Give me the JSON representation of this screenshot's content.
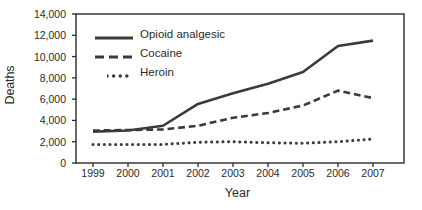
{
  "chart_data": {
    "type": "line",
    "title": "",
    "xlabel": "Year",
    "ylabel": "Deaths",
    "x": [
      1999,
      2000,
      2001,
      2002,
      2003,
      2004,
      2005,
      2006,
      2007
    ],
    "xtick_labels": [
      "1999",
      "2000",
      "2001",
      "2002",
      "2003",
      "2004",
      "2005",
      "2006",
      "2007"
    ],
    "ytick_labels": [
      "0",
      "2,000",
      "4,000",
      "6,000",
      "8,000",
      "10,000",
      "12,000",
      "14,000"
    ],
    "ytick_values": [
      0,
      2000,
      4000,
      6000,
      8000,
      10000,
      12000,
      14000
    ],
    "ylim": [
      0,
      14000
    ],
    "xlim": [
      1999,
      2007
    ],
    "grid": false,
    "legend_position": "upper-left-inside",
    "series": [
      {
        "name": "Opioid analgesic",
        "style": "solid",
        "color": "#3a3a3a",
        "values": [
          2950,
          3050,
          3500,
          5550,
          6550,
          7450,
          8550,
          11000,
          11500
        ]
      },
      {
        "name": "Cocaine",
        "style": "dashed",
        "color": "#3a3a3a",
        "values": [
          3050,
          3100,
          3150,
          3500,
          4250,
          4700,
          5400,
          6800,
          6100
        ]
      },
      {
        "name": "Heroin",
        "style": "dotted",
        "color": "#3a3a3a",
        "values": [
          1750,
          1750,
          1750,
          1950,
          2000,
          1900,
          1850,
          2000,
          2250
        ]
      }
    ]
  },
  "axis": {
    "y_title": "Deaths",
    "x_title": "Year"
  },
  "legend": {
    "items": [
      {
        "label": "Opioid analgesic",
        "style": "solid"
      },
      {
        "label": "Cocaine",
        "style": "dashed"
      },
      {
        "label": "Heroin",
        "style": "dotted"
      }
    ]
  },
  "colors": {
    "line": "#3a3a3a",
    "axis": "#2b2b2b",
    "background": "#ffffff",
    "text": "#2b2b2b"
  }
}
